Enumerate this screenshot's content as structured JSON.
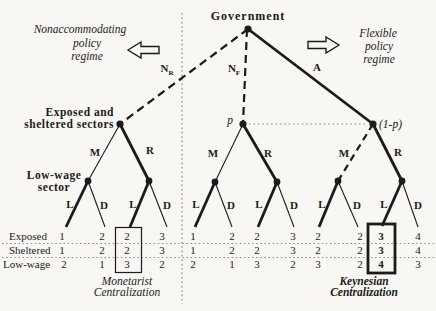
{
  "colors": {
    "ink": "#1b1b1b",
    "background": "#f8f7f3",
    "fine_dots": "#8c8c8c"
  },
  "root": {
    "label": "Government"
  },
  "regimes": {
    "left": {
      "line1": "Nonaccommodating",
      "line2": "policy",
      "line3": "regime"
    },
    "right": {
      "line1": "Flexible",
      "line2": "policy",
      "line3": "regime"
    }
  },
  "branches": {
    "n_base": "N",
    "nr_sub": "R",
    "nf_sub": "F",
    "a": "A",
    "m": "M",
    "r": "R",
    "l": "L",
    "d": "D"
  },
  "nodes": {
    "exposed_sheltered_line1": "Exposed and",
    "exposed_sheltered_line2": "sheltered sectors",
    "low_wage_line1": "Low-wage",
    "low_wage_line2": "sector",
    "p": "p",
    "one_minus_p": "(1-p)"
  },
  "payoff_table": {
    "rows": [
      {
        "label": "Exposed",
        "values": [
          "1",
          "2",
          "2",
          "3",
          "1",
          "2",
          "2",
          "3",
          "2",
          "2",
          "3",
          "4"
        ]
      },
      {
        "label": "Sheltered",
        "values": [
          "1",
          "2",
          "2",
          "3",
          "1",
          "2",
          "2",
          "3",
          "2",
          "2",
          "3",
          "4"
        ]
      },
      {
        "label": "Low-wage",
        "values": [
          "2",
          "1",
          "3",
          "2",
          "2",
          "1",
          "3",
          "2",
          "3",
          "2",
          "4",
          "3"
        ]
      }
    ],
    "highlight_monetarist_column": 3,
    "highlight_keynesian_column": 11
  },
  "captions": {
    "monetarist": {
      "line1": "Monetarist",
      "line2": "Centralization"
    },
    "keynesian": {
      "line1": "Keynesian",
      "line2": "Centralization"
    }
  }
}
